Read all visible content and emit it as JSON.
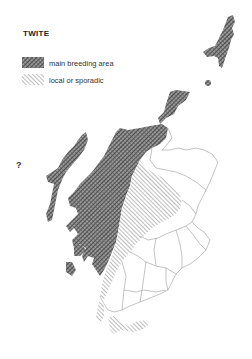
{
  "map": {
    "title": "TWITE",
    "region": "Scotland",
    "legend": [
      {
        "label": "main breeding area",
        "pattern": "dense-crosshatch",
        "color": "#555555"
      },
      {
        "label": "local or sporadic",
        "pattern": "diagonal-lines",
        "color": "#888888"
      }
    ],
    "annotations": [
      {
        "text": "?"
      }
    ]
  }
}
